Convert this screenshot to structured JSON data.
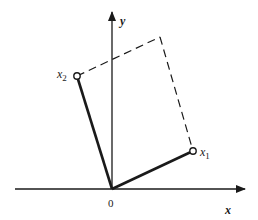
{
  "diagram": {
    "type": "vector-rotation",
    "origin_label": "0",
    "axes": {
      "x_label": "x",
      "y_label": "y"
    },
    "vectors": [
      {
        "name": "x1",
        "label_base": "x",
        "label_sub": "1"
      },
      {
        "name": "x2",
        "label_base": "x",
        "label_sub": "2"
      }
    ],
    "parallelogram_style": "dashed",
    "colors": {
      "stroke": "#1a1a1a",
      "background": "#ffffff"
    }
  }
}
